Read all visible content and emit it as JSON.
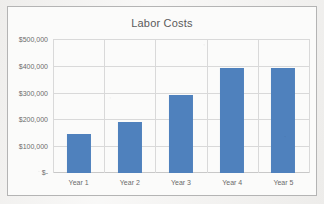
{
  "chart_data": {
    "type": "bar",
    "title": "Labor Costs",
    "xlabel": "",
    "ylabel": "",
    "categories": [
      "Year 1",
      "Year 2",
      "Year 3",
      "Year 4",
      "Year 5"
    ],
    "values": [
      145000,
      192000,
      292000,
      393000,
      391000
    ],
    "ylim": [
      0,
      500000
    ],
    "ytick_values": [
      500000,
      400000,
      300000,
      200000,
      100000,
      0
    ],
    "ytick_labels": [
      "$500,000",
      "$400,000",
      "$300,000",
      "$200,000",
      "$100,000",
      "$-"
    ],
    "grid": true,
    "legend": false,
    "series": [
      {
        "name": "Labor Costs",
        "color": "#4f81bd",
        "values": [
          145000,
          192000,
          292000,
          393000,
          391000
        ]
      }
    ]
  },
  "style": {
    "bar_color": "#4f81bd",
    "gridline_color": "#d9d9d9",
    "frame_color": "#b4b4b4",
    "text_color": "#6b6b6b",
    "title_color": "#5a5a5a",
    "background": "#f2f1ef",
    "plot_background": "#fbfbfa"
  }
}
